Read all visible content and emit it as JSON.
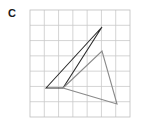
{
  "figure": {
    "part_label": "C",
    "label_color": "#1a1a1a",
    "background_color": "#ffffff",
    "grid": {
      "x0": 30,
      "y0": 10,
      "x1": 130,
      "y1": 117,
      "columns": 7,
      "rows": 7,
      "line_color": "#c9c9c9",
      "border_color": "#bdbdbd",
      "line_width": 0.8
    },
    "shapes": [
      {
        "name": "original-triangle",
        "stroke": "#2b2b2b",
        "stroke_width": 1.1,
        "fill": "none",
        "points": [
          [
            46,
            88
          ],
          [
            102,
            27
          ],
          [
            63,
            88
          ]
        ],
        "closed": true
      },
      {
        "name": "transformed-triangle",
        "stroke": "#8a8a8a",
        "stroke_width": 1.1,
        "fill": "none",
        "points": [
          [
            63,
            88
          ],
          [
            102,
            51
          ],
          [
            117,
            104
          ]
        ],
        "closed": true
      }
    ]
  }
}
